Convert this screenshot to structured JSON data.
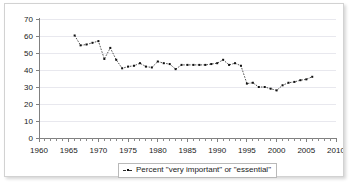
{
  "chart_data": {
    "type": "line",
    "title": "",
    "subtitle": "",
    "xlabel": "",
    "ylabel": "",
    "xlim": [
      1960,
      2010
    ],
    "ylim": [
      0,
      70
    ],
    "y_ticks": [
      0,
      10,
      20,
      30,
      40,
      50,
      60,
      70
    ],
    "x_ticks": [
      1960,
      1965,
      1970,
      1975,
      1980,
      1985,
      1990,
      1995,
      2000,
      2005,
      2010
    ],
    "x_minor_tick_step": 1,
    "grid": "horizontal",
    "legend_position": "bottom-center",
    "marker": "small-square",
    "line_style": "dotted",
    "line_color": "#2a2a2a",
    "series": [
      {
        "name": "Percent \"very important\" or \"essential\"",
        "x": [
          1966,
          1967,
          1968,
          1969,
          1970,
          1971,
          1972,
          1973,
          1974,
          1975,
          1976,
          1977,
          1978,
          1979,
          1980,
          1981,
          1982,
          1983,
          1984,
          1985,
          1986,
          1987,
          1988,
          1989,
          1990,
          1991,
          1992,
          1993,
          1994,
          1995,
          1996,
          1997,
          1998,
          1999,
          2000,
          2001,
          2002,
          2003,
          2004,
          2005,
          2006
        ],
        "values": [
          60.3,
          54.5,
          55.0,
          56.0,
          57.0,
          46.5,
          53.0,
          46.0,
          41.0,
          42.0,
          42.5,
          44.0,
          42.0,
          41.5,
          45.0,
          44.0,
          43.5,
          40.5,
          43.0,
          43.0,
          43.0,
          43.0,
          43.0,
          43.5,
          44.0,
          46.0,
          43.0,
          44.0,
          42.5,
          32.0,
          32.5,
          30.0,
          30.0,
          29.0,
          28.0,
          31.0,
          32.5,
          33.0,
          34.0,
          34.5,
          36.0
        ]
      }
    ]
  },
  "legend": {
    "entries": [
      {
        "label": "Percent \"very important\" or \"essential\""
      }
    ]
  },
  "axes": {
    "y_tick_labels": [
      "70",
      "60",
      "50",
      "40",
      "30",
      "20",
      "10",
      "0"
    ],
    "x_tick_labels": [
      "1960",
      "1965",
      "1970",
      "1975",
      "1980",
      "1985",
      "1990",
      "1995",
      "2000",
      "2005",
      "2010"
    ]
  }
}
